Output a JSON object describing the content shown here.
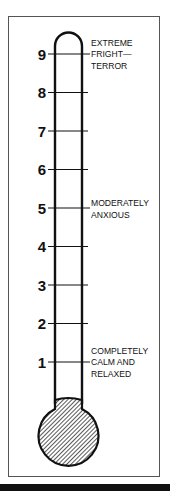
{
  "diagram": {
    "scale": {
      "min": 1,
      "max": 9,
      "ticks": [
        "1",
        "2",
        "3",
        "4",
        "5",
        "6",
        "7",
        "8",
        "9"
      ]
    },
    "annotations": [
      {
        "level": 9,
        "lines": [
          "EXTREME",
          "FRIGHT—",
          "TERROR"
        ]
      },
      {
        "level": 5,
        "lines": [
          "MODERATELY",
          "ANXIOUS"
        ]
      },
      {
        "level": 1,
        "lines": [
          "COMPLETELY",
          "CALM AND",
          "RELAXED"
        ]
      }
    ],
    "colors": {
      "ink": "#111111",
      "frame": "#555555",
      "background": "#ffffff"
    }
  }
}
